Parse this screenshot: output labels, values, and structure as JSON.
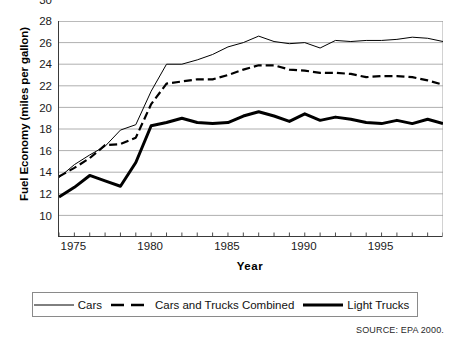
{
  "chart_data": {
    "type": "line",
    "title": "",
    "xlabel": "Year",
    "ylabel": "Fuel Economy (miles per gallon)",
    "xlim": [
      1974,
      1999
    ],
    "ylim": [
      10,
      30
    ],
    "yticks": [
      10,
      12,
      14,
      16,
      18,
      20,
      22,
      24,
      26,
      28,
      30
    ],
    "xticks": [
      1974,
      1975,
      1976,
      1977,
      1978,
      1979,
      1980,
      1981,
      1982,
      1983,
      1984,
      1985,
      1986,
      1987,
      1988,
      1989,
      1990,
      1991,
      1992,
      1993,
      1994,
      1995,
      1996,
      1997,
      1998,
      1999
    ],
    "xtick_labels": [
      {
        "value": 1975,
        "label": "1975"
      },
      {
        "value": 1980,
        "label": "1980"
      },
      {
        "value": 1985,
        "label": "1985"
      },
      {
        "value": 1990,
        "label": "1990"
      },
      {
        "value": 1995,
        "label": "1995"
      }
    ],
    "grid": "horizontal",
    "legend_position": "below",
    "x": [
      1974,
      1975,
      1976,
      1977,
      1978,
      1979,
      1980,
      1981,
      1982,
      1983,
      1984,
      1985,
      1986,
      1987,
      1988,
      1989,
      1990,
      1991,
      1992,
      1993,
      1994,
      1995,
      1996,
      1997,
      1998,
      1999
    ],
    "series": [
      {
        "name": "Cars",
        "style": "thin-solid",
        "values": [
          15.5,
          16.7,
          17.6,
          18.4,
          19.9,
          20.4,
          23.5,
          26.0,
          26.0,
          26.4,
          26.9,
          27.6,
          28.0,
          28.6,
          28.1,
          27.9,
          28.0,
          27.5,
          28.2,
          28.1,
          28.2,
          28.2,
          28.3,
          28.5,
          28.4,
          28.1
        ]
      },
      {
        "name": "Cars and Trucks Combined",
        "style": "dashed",
        "values": [
          15.6,
          16.4,
          17.3,
          18.5,
          18.6,
          19.2,
          22.3,
          24.2,
          24.4,
          24.6,
          24.6,
          25.0,
          25.5,
          25.9,
          25.9,
          25.5,
          25.4,
          25.2,
          25.2,
          25.1,
          24.8,
          24.9,
          24.9,
          24.8,
          24.5,
          24.1
        ]
      },
      {
        "name": "Light Trucks",
        "style": "thick-solid",
        "values": [
          13.7,
          14.6,
          15.7,
          15.2,
          14.7,
          16.9,
          20.3,
          20.6,
          21.0,
          20.6,
          20.5,
          20.6,
          21.2,
          21.6,
          21.2,
          20.7,
          21.4,
          20.8,
          21.1,
          20.9,
          20.6,
          20.5,
          20.8,
          20.5,
          20.9,
          20.5
        ]
      }
    ]
  },
  "axis": {
    "y_title": "Fuel Economy (miles per gallon)",
    "x_title": "Year"
  },
  "legend": {
    "items": [
      {
        "label": "Cars",
        "style": "thin-solid"
      },
      {
        "label": "Cars and Trucks Combined",
        "style": "dashed"
      },
      {
        "label": "Light Trucks",
        "style": "thick-solid"
      }
    ]
  },
  "footer": {
    "source": "SOURCE: EPA 2000."
  }
}
